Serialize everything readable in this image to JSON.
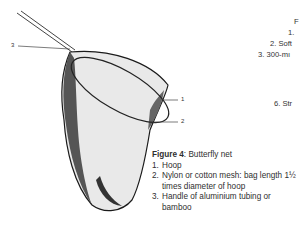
{
  "figure": {
    "title_bold": "Figure 4",
    "title_rest": ": Butterfly net",
    "callouts": [
      "3",
      "1",
      "2"
    ],
    "items": [
      {
        "num": "1.",
        "text": "Hoop"
      },
      {
        "num": "2.",
        "text": "Nylon or cotton mesh: bag length 1½ times diameter of hoop"
      },
      {
        "num": "3.",
        "text": "Handle of aluminium tubing or bamboo"
      }
    ]
  },
  "adjacent_column": {
    "lines": [
      "F",
      "1.",
      "2. Soft",
      "3. 300-mı",
      "6. Str"
    ]
  }
}
